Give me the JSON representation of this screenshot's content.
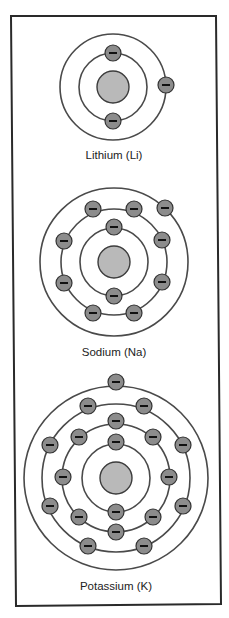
{
  "diagram": {
    "colors": {
      "background": "#ffffff",
      "frame": "#2a2a2a",
      "orbit": "#4a4a4a",
      "nucleus_fill": "#b9b9b9",
      "electron_fill": "#8c8c8c",
      "minus_sign": "#111111",
      "label": "#222222"
    },
    "frame": {
      "points": [
        [
          11,
          16
        ],
        [
          216,
          16
        ],
        [
          221,
          604
        ],
        [
          16,
          606
        ]
      ]
    },
    "electron_radius": 8,
    "atoms": [
      {
        "name": "Lithium",
        "symbol": "Li",
        "label": "Lithium (Li)",
        "center": [
          113,
          87
        ],
        "nucleus_radius": 16,
        "shell_radii": [
          34,
          53
        ],
        "electrons_per_shell": [
          2,
          1
        ],
        "electrons": [
          [
            113,
            53
          ],
          [
            113,
            121
          ],
          [
            166,
            85
          ]
        ],
        "label_position": [
          114,
          159
        ]
      },
      {
        "name": "Sodium",
        "symbol": "Na",
        "label": "Sodium (Na)",
        "center": [
          114,
          262
        ],
        "nucleus_radius": 16,
        "shell_radii": [
          34,
          53,
          74
        ],
        "electrons_per_shell": [
          2,
          8,
          1
        ],
        "electrons": [
          [
            114,
            227
          ],
          [
            114,
            296
          ],
          [
            93,
            209
          ],
          [
            134,
            209
          ],
          [
            64,
            241
          ],
          [
            162,
            240
          ],
          [
            64,
            283
          ],
          [
            162,
            282
          ],
          [
            93,
            313
          ],
          [
            134,
            313
          ],
          [
            165,
            208
          ]
        ],
        "label_position": [
          114,
          356
        ]
      },
      {
        "name": "Potassium",
        "symbol": "K",
        "label": "Potassium (K)",
        "center": [
          116,
          478
        ],
        "nucleus_radius": 16,
        "shell_radii": [
          34,
          54,
          74,
          92
        ],
        "electrons_per_shell": [
          2,
          8,
          8,
          1
        ],
        "electrons": [
          [
            116,
            442
          ],
          [
            116,
            512
          ],
          [
            116,
            421
          ],
          [
            79,
            437
          ],
          [
            153,
            437
          ],
          [
            63,
            477
          ],
          [
            169,
            477
          ],
          [
            79,
            517
          ],
          [
            153,
            517
          ],
          [
            116,
            532
          ],
          [
            88,
            406
          ],
          [
            144,
            406
          ],
          [
            50,
            445
          ],
          [
            183,
            445
          ],
          [
            50,
            506
          ],
          [
            183,
            506
          ],
          [
            88,
            546
          ],
          [
            144,
            546
          ],
          [
            116,
            382
          ]
        ],
        "label_position": [
          116,
          590
        ]
      }
    ]
  }
}
